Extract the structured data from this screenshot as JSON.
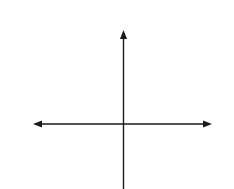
{
  "problem": {
    "number": "11."
  },
  "axes": {
    "x_label": "x",
    "y_label": "y",
    "x_tick_labels": [
      {
        "value": -7,
        "text": "−7"
      },
      {
        "value": -6,
        "text": "−6"
      },
      {
        "value": -5,
        "text": "−5"
      },
      {
        "value": -4,
        "text": "−4"
      },
      {
        "value": -3,
        "text": "−3"
      },
      {
        "value": -1,
        "text": "−1"
      },
      {
        "value": 1,
        "text": "1"
      },
      {
        "value": 2,
        "text": "2"
      },
      {
        "value": 6,
        "text": "6"
      },
      {
        "value": 7,
        "text": "7"
      }
    ],
    "y_tick_labels": [
      {
        "value": 7,
        "text": "7"
      },
      {
        "value": 6,
        "text": "6"
      },
      {
        "value": 5,
        "text": "5"
      },
      {
        "value": 4,
        "text": "4"
      },
      {
        "value": 3,
        "text": "3"
      },
      {
        "value": 2,
        "text": "2"
      },
      {
        "value": 1,
        "text": "1"
      },
      {
        "value": -1,
        "text": "−1"
      },
      {
        "value": -2,
        "text": "−2"
      },
      {
        "value": -3,
        "text": "−3"
      },
      {
        "value": -4,
        "text": "−4"
      },
      {
        "value": -5,
        "text": "−5"
      },
      {
        "value": -6,
        "text": "−6"
      }
    ],
    "x_range": [
      -7,
      7
    ],
    "y_range": [
      -6,
      7
    ]
  },
  "triangle": {
    "vertices": [
      {
        "name": "T",
        "x": -2,
        "y": 2
      },
      {
        "name": "R",
        "x": 6,
        "y": 0
      },
      {
        "name": "S",
        "x": -2,
        "y": -2
      }
    ]
  },
  "labels": {
    "T": "T",
    "R": "R",
    "S": "S"
  }
}
